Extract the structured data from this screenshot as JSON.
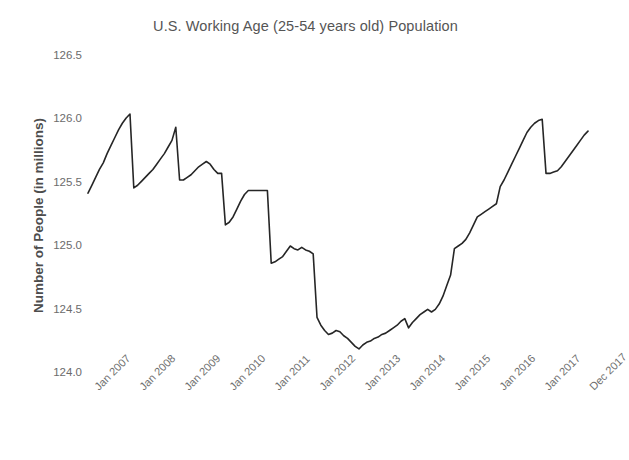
{
  "chart_data": {
    "type": "line",
    "title": "U.S. Working Age (25-54 years old) Population",
    "xlabel": "Date",
    "ylabel": "Number of People (in millions)",
    "ylim": [
      124.0,
      126.5
    ],
    "yticks": [
      "126.5",
      "126.0",
      "125.5",
      "125.0",
      "124.5",
      "124.0"
    ],
    "ytick_values": [
      126.5,
      126.0,
      125.5,
      125.0,
      124.5,
      124.0
    ],
    "xtick_labels": [
      "Jan 2007",
      "Jan 2008",
      "Jan 2009",
      "Jan 2010",
      "Jan 2011",
      "Jan 2012",
      "Jan 2013",
      "Jan 2014",
      "Jan 2015",
      "Jan 2016",
      "Jan 2017",
      "Dec 2017"
    ],
    "grid": false,
    "legend": "none",
    "line_color": "#262626",
    "xlim": [
      "2007-01",
      "2017-12"
    ],
    "series": [
      {
        "name": "U.S. Working Age Population",
        "units": "millions",
        "x": [
          "2007-01",
          "2007-02",
          "2007-03",
          "2007-04",
          "2007-05",
          "2007-06",
          "2007-07",
          "2007-08",
          "2007-09",
          "2007-10",
          "2007-11",
          "2007-12",
          "2008-01",
          "2008-02",
          "2008-03",
          "2008-04",
          "2008-05",
          "2008-06",
          "2008-07",
          "2008-08",
          "2008-09",
          "2008-10",
          "2008-11",
          "2008-12",
          "2009-01",
          "2009-02",
          "2009-03",
          "2009-04",
          "2009-05",
          "2009-06",
          "2009-07",
          "2009-08",
          "2009-09",
          "2009-10",
          "2009-11",
          "2009-12",
          "2010-01",
          "2010-02",
          "2010-03",
          "2010-04",
          "2010-05",
          "2010-06",
          "2010-07",
          "2010-08",
          "2010-09",
          "2010-10",
          "2010-11",
          "2010-12",
          "2011-01",
          "2011-02",
          "2011-03",
          "2011-04",
          "2011-05",
          "2011-06",
          "2011-07",
          "2011-08",
          "2011-09",
          "2011-10",
          "2011-11",
          "2011-12",
          "2012-01",
          "2012-02",
          "2012-03",
          "2012-04",
          "2012-05",
          "2012-06",
          "2012-07",
          "2012-08",
          "2012-09",
          "2012-10",
          "2012-11",
          "2012-12",
          "2013-01",
          "2013-02",
          "2013-03",
          "2013-04",
          "2013-05",
          "2013-06",
          "2013-07",
          "2013-08",
          "2013-09",
          "2013-10",
          "2013-11",
          "2013-12",
          "2014-01",
          "2014-02",
          "2014-03",
          "2014-04",
          "2014-05",
          "2014-06",
          "2014-07",
          "2014-08",
          "2014-09",
          "2014-10",
          "2014-11",
          "2014-12",
          "2015-01",
          "2015-02",
          "2015-03",
          "2015-04",
          "2015-05",
          "2015-06",
          "2015-07",
          "2015-08",
          "2015-09",
          "2015-10",
          "2015-11",
          "2015-12",
          "2016-01",
          "2016-02",
          "2016-03",
          "2016-04",
          "2016-05",
          "2016-06",
          "2016-07",
          "2016-08",
          "2016-09",
          "2016-10",
          "2016-11",
          "2016-12",
          "2017-01",
          "2017-02",
          "2017-03",
          "2017-04",
          "2017-05",
          "2017-06",
          "2017-07",
          "2017-08",
          "2017-09",
          "2017-10",
          "2017-11",
          "2017-12"
        ],
        "values": [
          125.4,
          125.46,
          125.52,
          125.58,
          125.63,
          125.7,
          125.76,
          125.82,
          125.88,
          125.93,
          125.97,
          126.0,
          125.44,
          125.46,
          125.49,
          125.52,
          125.55,
          125.58,
          125.62,
          125.66,
          125.7,
          125.75,
          125.8,
          125.9,
          125.5,
          125.5,
          125.52,
          125.54,
          125.57,
          125.6,
          125.62,
          125.64,
          125.62,
          125.58,
          125.55,
          125.55,
          125.16,
          125.18,
          125.22,
          125.28,
          125.34,
          125.39,
          125.42,
          125.42,
          125.42,
          125.42,
          125.42,
          125.42,
          124.87,
          124.88,
          124.9,
          124.92,
          124.96,
          125.0,
          124.98,
          124.97,
          124.99,
          124.97,
          124.96,
          124.94,
          124.46,
          124.4,
          124.36,
          124.33,
          124.34,
          124.36,
          124.35,
          124.32,
          124.3,
          124.27,
          124.24,
          124.22,
          124.25,
          124.27,
          124.28,
          124.3,
          124.31,
          124.33,
          124.34,
          124.36,
          124.38,
          124.4,
          124.43,
          124.45,
          124.38,
          124.42,
          124.45,
          124.48,
          124.5,
          124.52,
          124.5,
          124.52,
          124.56,
          124.62,
          124.7,
          124.78,
          124.98,
          125.0,
          125.02,
          125.05,
          125.1,
          125.16,
          125.22,
          125.24,
          125.26,
          125.28,
          125.3,
          125.32,
          125.45,
          125.5,
          125.56,
          125.62,
          125.68,
          125.74,
          125.8,
          125.86,
          125.9,
          125.93,
          125.95,
          125.96,
          125.55,
          125.55,
          125.56,
          125.57,
          125.6,
          125.64,
          125.68,
          125.72,
          125.76,
          125.8,
          125.84,
          125.87
        ]
      }
    ]
  }
}
